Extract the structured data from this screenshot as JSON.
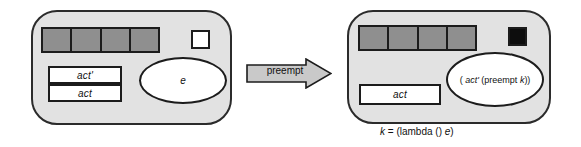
{
  "diagram": {
    "before": {
      "name": "before-state",
      "queue": {
        "label": "thread-queue",
        "cells": [
          "",
          "",
          "",
          ""
        ],
        "fill": "#8f8f8f"
      },
      "marker": {
        "label": "current-slot-empty",
        "fill": "#ffffff"
      },
      "boxes": [
        {
          "name": "act-prime-box",
          "text": "act'"
        },
        {
          "name": "act-box",
          "text": "act"
        }
      ],
      "ellipse": {
        "name": "expression-bubble",
        "text": "e"
      }
    },
    "arrow": {
      "label": "preempt",
      "fill": "#c9c9c9"
    },
    "after": {
      "name": "after-state",
      "queue": {
        "label": "thread-queue",
        "cells": [
          "",
          "",
          "",
          ""
        ],
        "fill": "#8f8f8f"
      },
      "marker": {
        "label": "current-slot-filled",
        "fill": "#0d0d0d"
      },
      "boxes": [
        {
          "name": "act-box",
          "text": "act"
        }
      ],
      "ellipse": {
        "name": "expression-bubble",
        "prefix": "( ",
        "italic1": "act'",
        "middle": " (preempt ",
        "italic2": "k",
        "suffix": "))",
        "full_text": "( act' (preempt k))"
      }
    },
    "caption": {
      "italic1": "k",
      "middle": " = (lambda () ",
      "italic2": "e",
      "suffix": ")",
      "full_text": "k = (lambda () e)"
    },
    "colors": {
      "panel_fill": "#e2e2e2",
      "outline": "#1c1c1c",
      "queue_fill": "#8f8f8f",
      "arrow_fill": "#c9c9c9",
      "white": "#ffffff",
      "black": "#0d0d0d"
    }
  }
}
